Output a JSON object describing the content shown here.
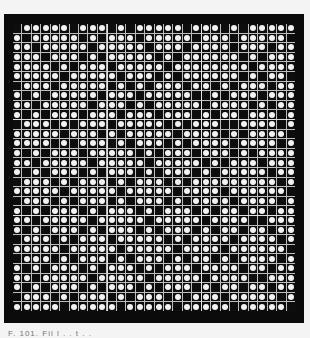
{
  "figure": {
    "caption": "F. 101.   Fil  l   .   . t . .",
    "grid": {
      "rows": 30,
      "cols": 30,
      "block_size": 10,
      "legend": {
        "B": "filled (black) cell",
        "W": "open cell (white dot)"
      },
      "pattern": [
        "BWWWWWBWWWBWBWWWWWBWWWBWBWWWWW",
        "WBWWWWWBWBWWWBWWWWWBWWWBWWWWWB",
        "WWBWWWWWBWWWWWBWWWBWWWWBWWWBWW",
        "WWWBWWWBWBWWWWWBWBWWWWWWBWBWWW",
        "WWWWBWBWWWBWWWWWBWWWWWWWWBWWWW",
        "WWWWWBWWWWWBWWWBWBWWWWWWBWBWWB",
        "BWWWBWWWWWBWBWBWWWBWWBWBWWWBWW",
        "WBWBWWWWWBWWWBWWWWWBBWBWWWBWWW",
        "WWBWWWWWBWWWBWBWWWWWBWWWWBWBWW",
        "WBWBWWWBWWWBWWWBWWWBWBWWBWWWBW",
        "BWWWBWBWWWBWWWWWBWBWWWBBWWWWBW",
        "WWWWWBWWWBWBWWWWWBWWWWBWBWWWWB",
        "WWWWBWBWWWBWBWWWBWBWWWWBWWWWBW",
        "WBWBWWWBWWWWWBWBWWWBWWWBWBWWWW",
        "WWBWWWWWBWWWWWBWWWWWBWBWWWBWWW",
        "WBWBWWWBWBWWWBWBWWWBWBWWWWWBWW",
        "BWWWBWBWWWBWBWWWBWBWWWWWWWWWBW",
        "WWWWWBWWWWWBWWWWWBWWWWBWWWWWWB",
        "BWWWBWBWWWBWBWWWBWBWWWWBWWWWBW",
        "WBWBWWWBWBWWWBWBWWWBWBWWBWWBWW",
        "WWBWWWWWBWWWWWBWWWWWBWWWWBBWWW",
        "WBWBWWWBWBWWWBWBWWWBWBWWBWWBWW",
        "BWWWBWBWWWBWWWWWBWBWWWWBWWWWBW",
        "WWWWWBWWWWWBWWWWWBWWWWBWWWWWWB",
        "BWWWBWBWWWBWBWWWBWBWWBWBWWWWBW",
        "WBWBWWWBWBWWWBWBWWWBWWWWBWWBWW",
        "WWBWWWWWBWWWWWBWWWWWBWWWWBBWWW",
        "WBWBWWWBWBWWWBWBWWWBWBWWBWWBWW",
        "BWWWBWBWWWBWBWWWBWBWWWBWWWWWBW",
        "WWWWWBWWWWWBWWWWWBWWWWWBWWWWWB"
      ]
    },
    "colors": {
      "frame": "#0b0b0b",
      "grid_line": "#bdbdbd",
      "block_line": "#e0e0e0",
      "dot": "#f2f2f2",
      "background": "#f4f4f4"
    }
  }
}
